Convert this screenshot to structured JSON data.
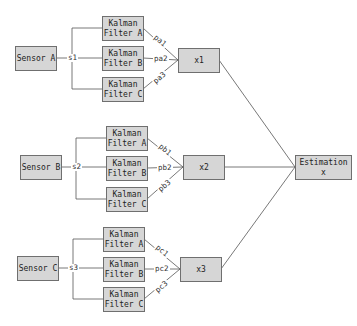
{
  "diagram": {
    "title": "",
    "sensors": [
      {
        "id": "A",
        "label": "Sensor A",
        "signal": "s1"
      },
      {
        "id": "B",
        "label": "Sensor B",
        "signal": "s2"
      },
      {
        "id": "C",
        "label": "Sensor C",
        "signal": "s3"
      }
    ],
    "filters": {
      "A": [
        {
          "line1": "Kalman",
          "line2": "Filter A",
          "weight": "pa1"
        },
        {
          "line1": "Kalman",
          "line2": "Filter B",
          "weight": "pa2"
        },
        {
          "line1": "Kalman",
          "line2": "Filter C",
          "weight": "pa3"
        }
      ],
      "B": [
        {
          "line1": "Kalman",
          "line2": "Filter A",
          "weight": "pb1"
        },
        {
          "line1": "Kalman",
          "line2": "Filter B",
          "weight": "pb2"
        },
        {
          "line1": "Kalman",
          "line2": "Filter C",
          "weight": "pb3"
        }
      ],
      "C": [
        {
          "line1": "Kalman",
          "line2": "Filter A",
          "weight": "pc1"
        },
        {
          "line1": "Kalman",
          "line2": "Filter B",
          "weight": "pc2"
        },
        {
          "line1": "Kalman",
          "line2": "Filter C",
          "weight": "pc3"
        }
      ]
    },
    "fusion_nodes": [
      {
        "label": "x1"
      },
      {
        "label": "x2"
      },
      {
        "label": "x3"
      }
    ],
    "output": {
      "line1": "Estimation",
      "line2": "x"
    },
    "colors": {
      "box_fill": "#d6d6d6",
      "box_border": "#6f6f6f",
      "line": "#555555"
    }
  }
}
